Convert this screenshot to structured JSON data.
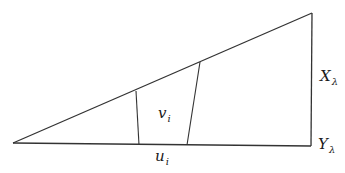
{
  "diagram": {
    "type": "geometric-figure",
    "stroke_color": "#333333",
    "outline": {
      "description": "right triangle-like quadrilateral",
      "points": [
        [
          13,
          143
        ],
        [
          312,
          13
        ],
        [
          311,
          146
        ]
      ]
    },
    "inner_segments": [
      {
        "from": [
          136,
          91
        ],
        "to": [
          139,
          145
        ]
      },
      {
        "from": [
          200,
          62
        ],
        "to": [
          187,
          145
        ]
      }
    ],
    "labels": {
      "v": {
        "base": "v",
        "sub": "i"
      },
      "u": {
        "base": "u",
        "sub": "i"
      },
      "X": {
        "base": "X",
        "sub": "λ"
      },
      "Y": {
        "base": "Y",
        "sub": "λ"
      }
    }
  }
}
